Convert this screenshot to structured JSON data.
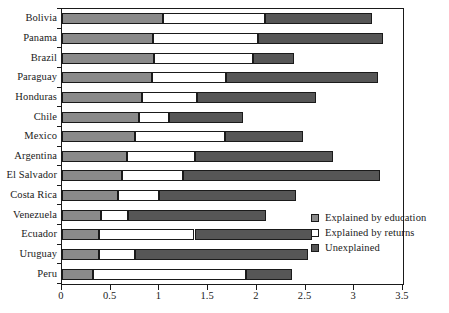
{
  "chart_data": {
    "type": "bar",
    "orientation": "horizontal",
    "stacked": true,
    "title": "",
    "xlabel": "",
    "ylabel": "",
    "xlim": [
      0,
      3.5
    ],
    "xticks": [
      0,
      0.5,
      1,
      1.5,
      2,
      2.5,
      3,
      3.5
    ],
    "xticklabels": [
      "0",
      "0.5",
      "1",
      "1.5",
      "2",
      "2.5",
      "3",
      "3.5"
    ],
    "grid": false,
    "legend_position": "inside-right-lower",
    "categories": [
      "Bolivia",
      "Panama",
      "Brazil",
      "Paraguay",
      "Honduras",
      "Chile",
      "Mexico",
      "Argentina",
      "El Salvador",
      "Costa Rica",
      "Venezuela",
      "Ecuador",
      "Uruguay",
      "Peru"
    ],
    "series": [
      {
        "name": "Explained by education",
        "color": "#8a8a8a",
        "values": [
          1.04,
          0.93,
          0.94,
          0.92,
          0.82,
          0.79,
          0.75,
          0.67,
          0.62,
          0.57,
          0.4,
          0.38,
          0.38,
          0.32
        ]
      },
      {
        "name": "Explained by returns",
        "color": "#ffffff",
        "values": [
          1.04,
          1.08,
          1.02,
          0.76,
          0.57,
          0.31,
          0.92,
          0.7,
          0.62,
          0.43,
          0.28,
          0.98,
          0.37,
          1.57
        ]
      },
      {
        "name": "Unexplained",
        "color": "#565656",
        "values": [
          1.1,
          1.28,
          0.42,
          1.56,
          1.22,
          0.76,
          0.8,
          1.41,
          2.02,
          1.4,
          1.41,
          1.21,
          1.77,
          0.47
        ]
      }
    ],
    "totals": [
      3.18,
      3.29,
      2.38,
      3.24,
      2.61,
      1.86,
      2.47,
      2.78,
      3.26,
      2.4,
      2.09,
      2.57,
      2.52,
      2.36
    ]
  },
  "legend": {
    "items": [
      {
        "label": "Explained by education",
        "swatch": "#8a8a8a"
      },
      {
        "label": "Explained by returns",
        "swatch": "#ffffff"
      },
      {
        "label": "Unexplained",
        "swatch": "#565656"
      }
    ]
  }
}
